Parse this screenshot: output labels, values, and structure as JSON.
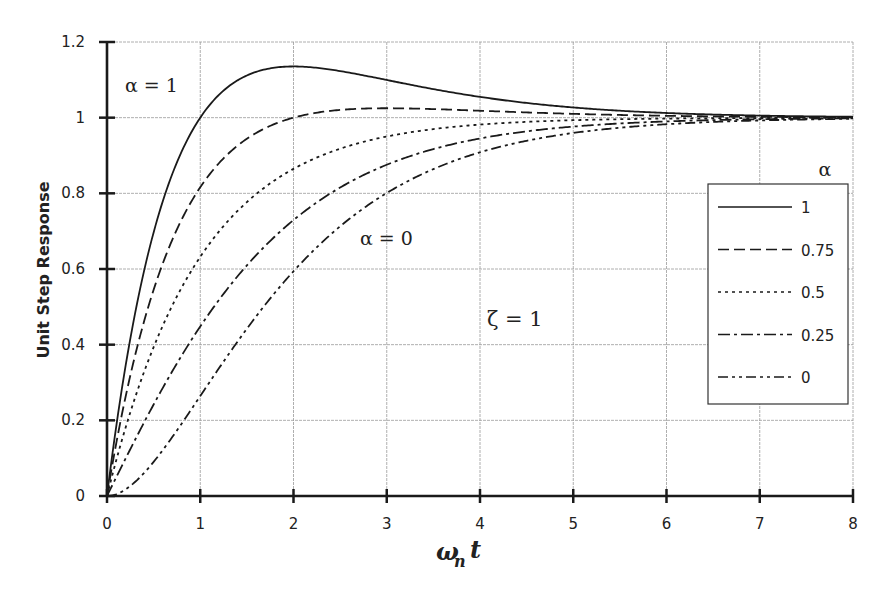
{
  "chart_data": {
    "type": "line",
    "title": "",
    "xlabel": "ω_n t",
    "ylabel": "Unit Step Response",
    "xlim": [
      0,
      8
    ],
    "ylim": [
      0,
      1.2
    ],
    "x_ticks": [
      "0",
      "1",
      "2",
      "3",
      "4",
      "5",
      "6",
      "7",
      "8"
    ],
    "y_ticks": [
      "0",
      "0.2",
      "0.4",
      "0.6",
      "0.8",
      "1",
      "1.2"
    ],
    "grid": true,
    "legend_position": "right",
    "legend_title": "α",
    "annotations": [
      "α = 1",
      "α = 0",
      "ζ = 1"
    ],
    "x": [
      0,
      0.5,
      1,
      1.5,
      2,
      2.5,
      3,
      3.5,
      4,
      4.5,
      5,
      5.5,
      6,
      6.5,
      7,
      7.5,
      8
    ],
    "series": [
      {
        "name": "1",
        "style": "solid",
        "values": [
          0,
          0.394,
          1.0,
          1.112,
          1.135,
          1.123,
          1.1,
          1.076,
          1.055,
          1.039,
          1.027,
          1.018,
          1.012,
          1.008,
          1.005,
          1.003,
          1.002
        ]
      },
      {
        "name": "0.75",
        "style": "dashed",
        "values": [
          0,
          0.318,
          0.816,
          0.944,
          0.999,
          1.021,
          1.025,
          1.023,
          1.018,
          1.014,
          1.01,
          1.007,
          1.005,
          1.003,
          1.002,
          1.001,
          1.001
        ]
      },
      {
        "name": "0.5",
        "style": "dotted",
        "values": [
          0,
          0.242,
          0.632,
          0.777,
          0.865,
          0.918,
          0.95,
          0.97,
          0.982,
          0.989,
          0.993,
          0.996,
          0.998,
          0.998,
          0.999,
          0.999,
          1.0
        ]
      },
      {
        "name": "0.25",
        "style": "dash-dot",
        "values": [
          0,
          0.167,
          0.448,
          0.609,
          0.73,
          0.815,
          0.876,
          0.917,
          0.945,
          0.964,
          0.976,
          0.985,
          0.99,
          0.994,
          0.996,
          0.997,
          0.998
        ]
      },
      {
        "name": "0",
        "style": "dash-dot-dot",
        "values": [
          0,
          0.09,
          0.264,
          0.442,
          0.594,
          0.713,
          0.801,
          0.864,
          0.908,
          0.939,
          0.96,
          0.973,
          0.983,
          0.989,
          0.993,
          0.995,
          0.997
        ]
      }
    ]
  },
  "labels": {
    "ylabel": "Unit Step Response",
    "xlabel_main": "ω",
    "xlabel_sub": "n",
    "xlabel_t": "t",
    "ann_alpha1": "α = 1",
    "ann_alpha0": "α = 0",
    "ann_zeta": "ζ = 1",
    "legend_title": "α"
  },
  "colors": {
    "ink": "#1a1a1a",
    "grid": "#9a9a9a",
    "background": "#ffffff"
  }
}
